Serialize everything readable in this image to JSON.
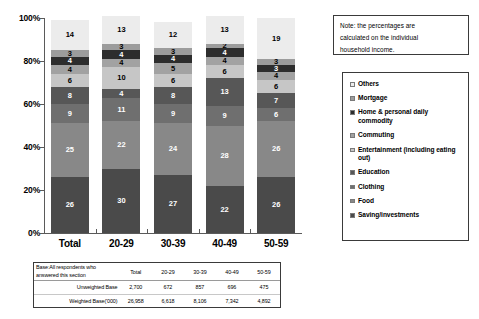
{
  "chart_data": {
    "type": "bar",
    "stacked": true,
    "stack_mode": "percent",
    "title": "",
    "xlabel": "",
    "ylabel": "",
    "ylim": [
      0,
      100
    ],
    "grid": false,
    "legend_position": "right",
    "y_ticks": [
      "0%",
      "20%",
      "40%",
      "60%",
      "80%",
      "100%"
    ],
    "y_tick_values": [
      0,
      20,
      40,
      60,
      80,
      100
    ],
    "categories": [
      "Total",
      "20-29",
      "30-39",
      "40-49",
      "50-59"
    ],
    "series": [
      {
        "name": "Saving/investments",
        "color": "#4a4a4a",
        "values": [
          26,
          30,
          27,
          22,
          26
        ]
      },
      {
        "name": "Food",
        "color": "#888888",
        "values": [
          25,
          22,
          24,
          28,
          26
        ]
      },
      {
        "name": "Clothing",
        "color": "#6f6f6f",
        "values": [
          9,
          11,
          9,
          9,
          6
        ]
      },
      {
        "name": "Education",
        "color": "#575757",
        "values": [
          8,
          4,
          8,
          13,
          7
        ]
      },
      {
        "name": "Entertainment (including eating out)",
        "color": "#c6c6c6",
        "values": [
          6,
          10,
          6,
          6,
          6
        ]
      },
      {
        "name": "Commuting",
        "color": "#a2a2a2",
        "values": [
          4,
          4,
          5,
          4,
          4
        ]
      },
      {
        "name": "Home & personal daily commodity",
        "color": "#2d2d2d",
        "values": [
          4,
          4,
          4,
          4,
          3
        ]
      },
      {
        "name": "Mortgage",
        "color": "#9c9c9c",
        "values": [
          3,
          3,
          3,
          2,
          3
        ]
      },
      {
        "name": "Others",
        "color": "#ececec",
        "values": [
          14,
          13,
          12,
          13,
          19
        ]
      }
    ]
  },
  "note": {
    "lines": [
      "Note: the percentages are",
      "calculated on the individual",
      "household income."
    ]
  },
  "legend": {
    "items": [
      {
        "label": "Others",
        "color": "#ececec"
      },
      {
        "label": "Mortgage",
        "color": "#9c9c9c"
      },
      {
        "label": "Home & personal daily commodity",
        "color": "#2d2d2d"
      },
      {
        "label": "Commuting",
        "color": "#a2a2a2"
      },
      {
        "label": "Entertainment (including eating out)",
        "color": "#c6c6c6"
      },
      {
        "label": "Education",
        "color": "#575757"
      },
      {
        "label": "Clothing",
        "color": "#6f6f6f"
      },
      {
        "label": "Food",
        "color": "#888888"
      },
      {
        "label": "Saving/investments",
        "color": "#4a4a4a"
      }
    ]
  },
  "base_table": {
    "caption": "Base:All respondents who answered this section",
    "columns": [
      "Total",
      "20-29",
      "30-39",
      "40-49",
      "50-59"
    ],
    "rows": [
      {
        "label": "Unweighted Base",
        "values": [
          "2,700",
          "672",
          "857",
          "696",
          "475"
        ]
      },
      {
        "label": "Weighted Base('000)",
        "values": [
          "26,958",
          "6,618",
          "8,106",
          "7,342",
          "4,892"
        ]
      }
    ]
  }
}
